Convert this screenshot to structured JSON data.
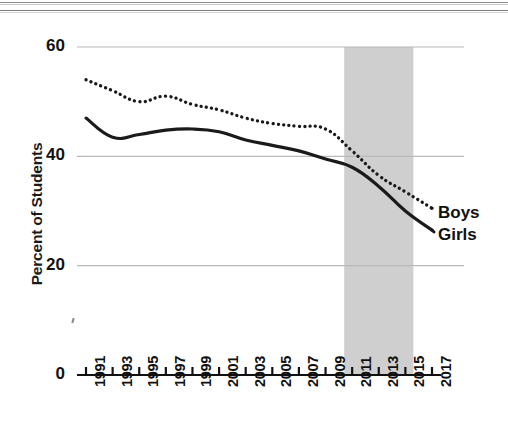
{
  "chart_data": {
    "type": "line",
    "title": "",
    "subtitle": "",
    "xlabel": "",
    "ylabel": "Percent of Students",
    "ylim": [
      0,
      60
    ],
    "xlim": [
      1991,
      2017
    ],
    "y_ticks": [
      0,
      20,
      40,
      60
    ],
    "y_tick_labels": [
      "0",
      "20",
      "40",
      "60"
    ],
    "x_ticks": [
      1991,
      1993,
      1995,
      1997,
      1999,
      2001,
      2003,
      2005,
      2007,
      2009,
      2011,
      2013,
      2015,
      2017
    ],
    "x_tick_labels": [
      "1991",
      "1993",
      "1995",
      "1997",
      "1999",
      "2001",
      "2003",
      "2005",
      "2007",
      "2009",
      "2011",
      "2013",
      "2015",
      "2017"
    ],
    "grid": "horizontal",
    "legend_position": "right-inline",
    "x": [
      1991,
      1993,
      1995,
      1997,
      1999,
      2001,
      2003,
      2005,
      2007,
      2009,
      2011,
      2013,
      2015,
      2017
    ],
    "series": [
      {
        "name": "Boys",
        "style": "dotted",
        "color": "#1a1a1a",
        "values": [
          54.0,
          52.0,
          50.0,
          51.0,
          49.5,
          48.5,
          47.0,
          46.0,
          45.5,
          45.0,
          41.0,
          36.5,
          33.5,
          30.5
        ]
      },
      {
        "name": "Girls",
        "style": "solid",
        "color": "#1a1a1a",
        "values": [
          47.0,
          43.5,
          44.0,
          44.8,
          45.0,
          44.5,
          43.0,
          42.0,
          41.0,
          39.5,
          38.0,
          34.5,
          30.0,
          26.5
        ]
      }
    ],
    "annotations": [
      {
        "type": "shaded-band",
        "name": "highlight-band",
        "x_start": 2010.4,
        "x_end": 2015.6,
        "color": "#cfcfcf"
      }
    ]
  },
  "axis": {
    "y_title": "Percent of Students"
  },
  "legend": {
    "boys": "Boys",
    "girls": "Girls"
  }
}
